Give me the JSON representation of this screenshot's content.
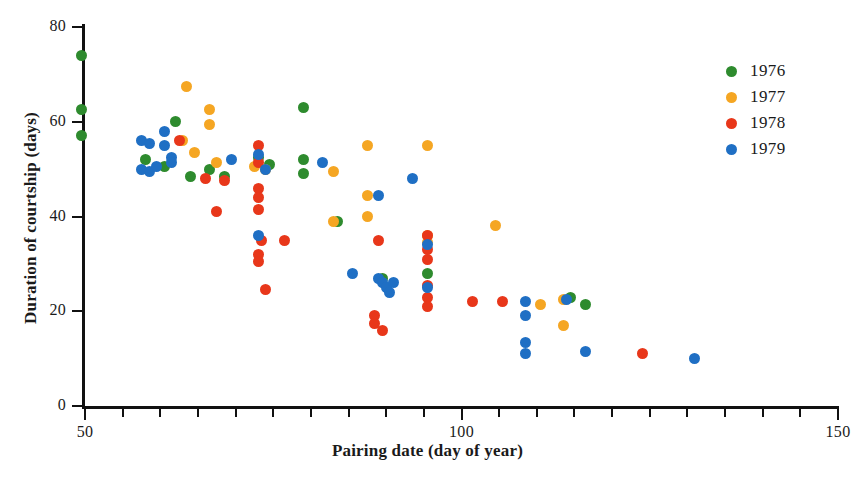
{
  "chart_data": {
    "type": "scatter",
    "title": "",
    "xlabel": "Pairing date (day of year)",
    "ylabel": "Duration of courtship (days)",
    "xlim": [
      45,
      151
    ],
    "ylim": [
      0,
      80
    ],
    "xticks_labeled": [
      "50",
      "100",
      "150"
    ],
    "xticks_labeled_values": [
      50,
      100,
      150
    ],
    "xtick_step_minor": 5,
    "yticks_labeled": [
      "0",
      "20",
      "40",
      "60",
      "80"
    ],
    "yticks_labeled_values": [
      0,
      20,
      40,
      60,
      80
    ],
    "grid": false,
    "legend_position": "top-right",
    "series": [
      {
        "name": "1976",
        "color": "#2e8b2e",
        "points": [
          [
            49.5,
            74.0
          ],
          [
            49.5,
            62.5
          ],
          [
            49.5,
            57.0
          ],
          [
            58.0,
            52.0
          ],
          [
            60.5,
            50.5
          ],
          [
            62.0,
            60.0
          ],
          [
            64.0,
            48.5
          ],
          [
            66.5,
            50.0
          ],
          [
            68.5,
            48.5
          ],
          [
            73.0,
            52.5
          ],
          [
            74.5,
            51.0
          ],
          [
            79.0,
            63.0
          ],
          [
            79.0,
            52.0
          ],
          [
            79.0,
            49.0
          ],
          [
            83.5,
            39.0
          ],
          [
            89.5,
            27.0
          ],
          [
            95.5,
            28.0
          ],
          [
            114.5,
            23.0
          ],
          [
            116.5,
            21.5
          ]
        ]
      },
      {
        "name": "1977",
        "color": "#f5a623",
        "points": [
          [
            63.5,
            67.5
          ],
          [
            66.5,
            62.5
          ],
          [
            66.5,
            59.5
          ],
          [
            63.0,
            56.0
          ],
          [
            64.5,
            53.5
          ],
          [
            67.5,
            51.5
          ],
          [
            72.5,
            50.5
          ],
          [
            74.0,
            50.0
          ],
          [
            83.0,
            49.5
          ],
          [
            83.0,
            39.0
          ],
          [
            87.5,
            55.0
          ],
          [
            87.5,
            44.5
          ],
          [
            87.5,
            40.0
          ],
          [
            95.5,
            55.0
          ],
          [
            95.5,
            36.0
          ],
          [
            95.5,
            34.5
          ],
          [
            104.5,
            38.0
          ],
          [
            110.5,
            21.5
          ],
          [
            113.5,
            22.5
          ],
          [
            113.5,
            17.0
          ]
        ]
      },
      {
        "name": "1978",
        "color": "#e8371a",
        "points": [
          [
            62.5,
            56.0
          ],
          [
            66.0,
            48.0
          ],
          [
            68.5,
            47.5
          ],
          [
            67.5,
            41.0
          ],
          [
            73.0,
            55.0
          ],
          [
            73.0,
            51.5
          ],
          [
            73.0,
            46.0
          ],
          [
            73.0,
            44.0
          ],
          [
            73.0,
            41.5
          ],
          [
            73.0,
            32.0
          ],
          [
            73.5,
            35.0
          ],
          [
            76.5,
            35.0
          ],
          [
            73.0,
            30.5
          ],
          [
            74.0,
            24.5
          ],
          [
            89.0,
            35.0
          ],
          [
            88.5,
            19.0
          ],
          [
            88.5,
            17.5
          ],
          [
            89.5,
            16.0
          ],
          [
            95.5,
            36.0
          ],
          [
            95.5,
            33.0
          ],
          [
            95.5,
            31.0
          ],
          [
            95.5,
            25.5
          ],
          [
            95.5,
            23.0
          ],
          [
            95.5,
            21.0
          ],
          [
            101.5,
            22.0
          ],
          [
            105.5,
            22.0
          ],
          [
            124.0,
            11.0
          ]
        ]
      },
      {
        "name": "1979",
        "color": "#1f6fc4",
        "points": [
          [
            57.5,
            56.0
          ],
          [
            58.5,
            55.5
          ],
          [
            60.5,
            55.0
          ],
          [
            60.5,
            58.0
          ],
          [
            61.5,
            52.5
          ],
          [
            61.5,
            51.5
          ],
          [
            57.5,
            50.0
          ],
          [
            58.5,
            49.5
          ],
          [
            59.5,
            50.5
          ],
          [
            69.5,
            52.0
          ],
          [
            73.0,
            53.0
          ],
          [
            74.0,
            50.0
          ],
          [
            73.0,
            36.0
          ],
          [
            81.5,
            51.5
          ],
          [
            85.5,
            28.0
          ],
          [
            89.0,
            44.5
          ],
          [
            89.0,
            27.0
          ],
          [
            89.5,
            26.0
          ],
          [
            90.0,
            25.0
          ],
          [
            90.5,
            24.0
          ],
          [
            91.0,
            26.0
          ],
          [
            93.5,
            48.0
          ],
          [
            95.5,
            34.0
          ],
          [
            95.5,
            25.0
          ],
          [
            108.5,
            22.0
          ],
          [
            108.5,
            19.0
          ],
          [
            108.5,
            13.5
          ],
          [
            108.5,
            11.0
          ],
          [
            114.0,
            22.5
          ],
          [
            116.5,
            11.5
          ],
          [
            131.0,
            10.0
          ]
        ]
      }
    ]
  },
  "legend": {
    "items": [
      {
        "label": "1976",
        "color": "#2e8b2e"
      },
      {
        "label": "1977",
        "color": "#f5a623"
      },
      {
        "label": "1978",
        "color": "#e8371a"
      },
      {
        "label": "1979",
        "color": "#1f6fc4"
      }
    ]
  },
  "axes": {
    "x_title": "Pairing date (day of year)",
    "y_title": "Duration of courtship (days)",
    "x_tick_labels": [
      {
        "value": 50,
        "text": "50"
      },
      {
        "value": 100,
        "text": "100"
      },
      {
        "value": 150,
        "text": "150"
      }
    ],
    "y_tick_labels": [
      {
        "value": 0,
        "text": "0"
      },
      {
        "value": 20,
        "text": "20"
      },
      {
        "value": 40,
        "text": "40"
      },
      {
        "value": 60,
        "text": "60"
      },
      {
        "value": 80,
        "text": "80"
      }
    ]
  }
}
